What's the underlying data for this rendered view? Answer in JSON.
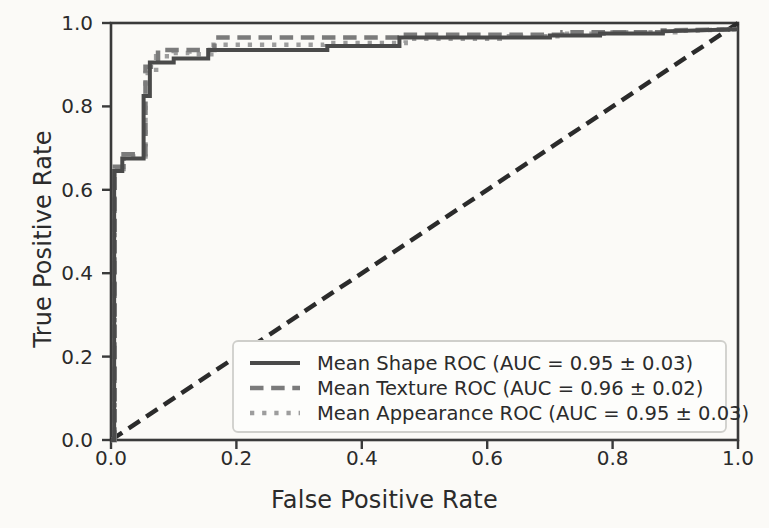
{
  "chart_data": {
    "type": "line",
    "title": "",
    "xlabel": "False Positive Rate",
    "ylabel": "True Positive Rate",
    "xlim": [
      0.0,
      1.0
    ],
    "ylim": [
      0.0,
      1.0
    ],
    "grid": false,
    "legend_position": "lower right",
    "xticks": [
      "0.0",
      "0.2",
      "0.4",
      "0.6",
      "0.8",
      "1.0"
    ],
    "xtick_values": [
      0.0,
      0.2,
      0.4,
      0.6,
      0.8,
      1.0
    ],
    "yticks": [
      "0.0",
      "0.2",
      "0.4",
      "0.6",
      "0.8",
      "1.0"
    ],
    "ytick_values": [
      0.0,
      0.2,
      0.4,
      0.6,
      0.8,
      1.0
    ],
    "series": [
      {
        "name": "Mean Shape ROC (AUC = 0.95 ± 0.03)",
        "short_name": "Mean Shape ROC",
        "auc": 0.95,
        "auc_std": 0.03,
        "style": "solid",
        "color": "#4a4a4a",
        "width": 4.0,
        "x": [
          0.0,
          0.005,
          0.005,
          0.018,
          0.018,
          0.052,
          0.052,
          0.062,
          0.062,
          0.1,
          0.1,
          0.155,
          0.155,
          0.345,
          0.345,
          0.46,
          0.46,
          0.7,
          0.7,
          0.78,
          0.78,
          0.88,
          0.88,
          1.0
        ],
        "y": [
          0.0,
          0.0,
          0.645,
          0.645,
          0.675,
          0.675,
          0.825,
          0.825,
          0.905,
          0.905,
          0.915,
          0.915,
          0.935,
          0.935,
          0.945,
          0.945,
          0.965,
          0.965,
          0.97,
          0.97,
          0.975,
          0.975,
          0.98,
          0.985
        ]
      },
      {
        "name": "Mean Texture ROC (AUC = 0.96 ± 0.02)",
        "short_name": "Mean Texture ROC",
        "auc": 0.96,
        "auc_std": 0.02,
        "style": "dashed",
        "color": "#7b7b7b",
        "width": 4.5,
        "x": [
          0.0,
          0.006,
          0.006,
          0.02,
          0.02,
          0.055,
          0.055,
          0.075,
          0.075,
          0.165,
          0.165,
          0.46,
          0.46,
          0.72,
          0.72,
          0.88,
          0.88,
          1.0
        ],
        "y": [
          0.0,
          0.0,
          0.655,
          0.655,
          0.685,
          0.685,
          0.895,
          0.895,
          0.935,
          0.935,
          0.965,
          0.965,
          0.972,
          0.972,
          0.978,
          0.978,
          0.982,
          0.985
        ]
      },
      {
        "name": "Mean Appearance ROC (AUC = 0.95 ± 0.03)",
        "short_name": "Mean Appearance ROC",
        "auc": 0.95,
        "auc_std": 0.03,
        "style": "dotted",
        "color": "#9d9d9d",
        "width": 4.5,
        "x": [
          0.0,
          0.006,
          0.006,
          0.02,
          0.02,
          0.055,
          0.055,
          0.072,
          0.072,
          0.1,
          0.1,
          0.125,
          0.125,
          0.16,
          0.16,
          0.34,
          0.34,
          0.47,
          0.47,
          0.62,
          0.62,
          0.72,
          0.72,
          0.8,
          0.8,
          0.9,
          0.9,
          1.0
        ],
        "y": [
          0.0,
          0.0,
          0.65,
          0.65,
          0.68,
          0.68,
          0.88,
          0.88,
          0.92,
          0.92,
          0.928,
          0.928,
          0.925,
          0.925,
          0.948,
          0.948,
          0.952,
          0.952,
          0.962,
          0.962,
          0.968,
          0.968,
          0.974,
          0.974,
          0.978,
          0.978,
          0.981,
          0.985
        ]
      }
    ],
    "reference_line": {
      "name": "chance-diagonal",
      "style": "dashed",
      "color": "#2b2b2b",
      "width": 4.5,
      "x": [
        0.0,
        1.0
      ],
      "y": [
        0.0,
        1.0
      ]
    }
  },
  "legend": {
    "entries": [
      {
        "label": "Mean Shape ROC (AUC = 0.95 ± 0.03)"
      },
      {
        "label": "Mean Texture ROC (AUC = 0.96 ± 0.02)"
      },
      {
        "label": "Mean Appearance ROC (AUC = 0.95 ± 0.03)"
      }
    ]
  },
  "axes": {
    "xlabel": "False Positive Rate",
    "ylabel": "True Positive Rate"
  }
}
